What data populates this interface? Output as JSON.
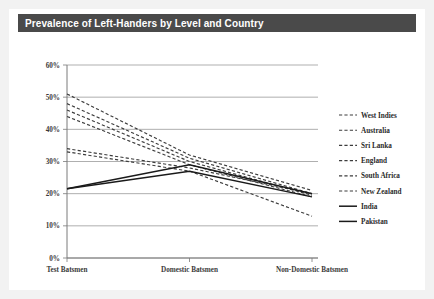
{
  "title": "Prevalence of Left-Handers by Level and Country",
  "chart_data": {
    "type": "line",
    "title": "Prevalence of Left-Handers by Level and Country",
    "xlabel": "",
    "ylabel": "",
    "categories": [
      "Test Batsmen",
      "Domestic Batsmen",
      "Non-Domestic Batsmen"
    ],
    "ylim": [
      0,
      60
    ],
    "yticks": [
      "0%",
      "10%",
      "20%",
      "30%",
      "40%",
      "50%",
      "60%"
    ],
    "ytick_values": [
      0,
      10,
      20,
      30,
      40,
      50,
      60
    ],
    "grid": true,
    "legend_position": "right",
    "series": [
      {
        "name": "West Indies",
        "style": "dashed",
        "values": [
          51.0,
          32.0,
          21.0
        ]
      },
      {
        "name": "Australia",
        "style": "dashed",
        "values": [
          48.0,
          31.0,
          20.0
        ]
      },
      {
        "name": "Sri Lanka",
        "style": "dashed",
        "values": [
          46.0,
          30.0,
          19.5
        ]
      },
      {
        "name": "England",
        "style": "dashed",
        "values": [
          44.0,
          29.0,
          19.0
        ]
      },
      {
        "name": "South Africa",
        "style": "dashed",
        "values": [
          34.0,
          28.0,
          20.0
        ]
      },
      {
        "name": "New Zealand",
        "style": "dashed",
        "values": [
          33.0,
          27.0,
          13.0
        ]
      },
      {
        "name": "India",
        "style": "solid",
        "values": [
          21.5,
          29.0,
          20.0
        ]
      },
      {
        "name": "Pakistan",
        "style": "solid",
        "values": [
          21.5,
          27.0,
          19.0
        ]
      }
    ]
  }
}
